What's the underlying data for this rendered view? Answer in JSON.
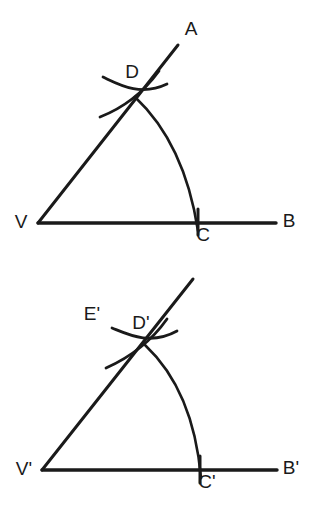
{
  "document": {
    "title": "Copying an Angle — Compass and Straightedge Construction",
    "background_color": "#ffffff",
    "ink_color": "#1a1a1a",
    "width": 315,
    "height": 507
  },
  "style": {
    "ray_width": 3.0,
    "baseline_width": 3.4,
    "arc_width": 2.6,
    "tick_width": 3.0,
    "label_size": 19,
    "label_color": "#1a1a1a"
  },
  "figures": [
    {
      "id": "figure-original-angle",
      "name": "original-angle",
      "caption": "Original angle AVB with arc CD and intersecting compass arcs at D",
      "vertex": {
        "name": "V",
        "label": "V",
        "x": 38,
        "y": 223,
        "label_x": 21,
        "label_y": 223
      },
      "ray_endpoint": {
        "name": "A",
        "label": "A",
        "x": 178,
        "y": 45,
        "label_x": 191,
        "label_y": 30
      },
      "baseline_endpoint": {
        "name": "B",
        "label": "B",
        "x": 276,
        "y": 223,
        "label_x": 289,
        "label_y": 222
      },
      "arc_base_point": {
        "name": "C",
        "label": "C",
        "x": 198,
        "y": 223,
        "label_x": 203,
        "label_y": 236
      },
      "arc_ray_point": {
        "name": "D",
        "label": "D",
        "x": 135,
        "y": 97,
        "label_x": 132,
        "label_y": 73
      },
      "geometry": {
        "ray_path": "M 38 223 L 178 45",
        "baseline_path": "M 38 223 L 276 223",
        "main_arc_path": "M 135 97 C 168 128 189 172 198 231",
        "compass_arc_1_path": "M 103 77 C 118 84 140 97 167 84",
        "compass_arc_2_path": "M 100 117 C 118 110 140 97 159 71",
        "tick_path": "M 198 209 L 198 235"
      }
    },
    {
      "id": "figure-copied-angle",
      "name": "copied-angle",
      "caption": "Copied angle at V' with arc C'D' and intersecting compass arcs at D' with point E'",
      "vertex": {
        "name": "V'",
        "label": "V'",
        "x": 42,
        "y": 470,
        "label_x": 24,
        "label_y": 470
      },
      "ray_endpoint": {
        "name": "ray-tip",
        "label": "",
        "x": 193,
        "y": 279,
        "label_x": 0,
        "label_y": 0
      },
      "baseline_endpoint": {
        "name": "B'",
        "label": "B'",
        "x": 277,
        "y": 470,
        "label_x": 291,
        "label_y": 469
      },
      "arc_base_point": {
        "name": "C'",
        "label": "C'",
        "x": 200,
        "y": 470,
        "label_x": 207,
        "label_y": 483
      },
      "arc_ray_point": {
        "name": "D'",
        "label": "D'",
        "x": 145,
        "y": 345,
        "label_x": 141,
        "label_y": 324
      },
      "extra_point": {
        "name": "E'",
        "label": "E'",
        "x": 108,
        "y": 329,
        "label_x": 92,
        "label_y": 315
      },
      "geometry": {
        "ray_path": "M 42 470 L 193 279",
        "baseline_path": "M 42 470 L 277 470",
        "main_arc_path": "M 145 345 C 178 376 196 420 201 478",
        "compass_arc_1_path": "M 112 328 C 127 334 150 346 177 331",
        "compass_arc_2_path": "M 106 368 C 124 360 148 346 167 319",
        "tick_path": "M 200 456 L 200 483"
      }
    }
  ]
}
